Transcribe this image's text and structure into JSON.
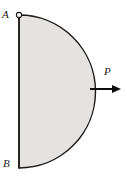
{
  "figure": {
    "type": "engineering-free-body-diagram",
    "background_color": "#ffffff",
    "shape": {
      "name": "semicircular-plate",
      "fill_color": "#e4e3e1",
      "stroke_color": "#1a1a1a",
      "stroke_width": 1.4,
      "straight_edge": {
        "name": "diameter-edge",
        "orientation": "vertical",
        "x": 19,
        "y_top": 15,
        "y_bottom": 168
      },
      "curved_edge": {
        "name": "semicircular-arc",
        "center_x": 19,
        "center_y": 91.5,
        "radius": 71,
        "bulge_direction": "right",
        "rightmost_x": 90
      }
    },
    "markers": [
      {
        "name": "pin-support-circle",
        "label": "A",
        "x": 19,
        "y": 15,
        "radius": 2.6,
        "fill_color": "#ffffff",
        "stroke_color": "#1a1a1a"
      }
    ],
    "labels": [
      {
        "name": "point-label-a",
        "text": "A",
        "x": 2,
        "y": 9,
        "style": "italic"
      },
      {
        "name": "point-label-b",
        "text": "B",
        "x": 3,
        "y": 158,
        "style": "italic"
      },
      {
        "name": "force-label-p",
        "text": "P",
        "x": 104,
        "y": 66,
        "style": "italic"
      }
    ],
    "force_arrow": {
      "name": "force-arrow-p",
      "label": "P",
      "direction": "right",
      "x_start": 90,
      "x_end": 121,
      "y": 89,
      "line_width": 2,
      "head_length": 9,
      "head_width": 8,
      "color": "#0d0d0d"
    }
  }
}
